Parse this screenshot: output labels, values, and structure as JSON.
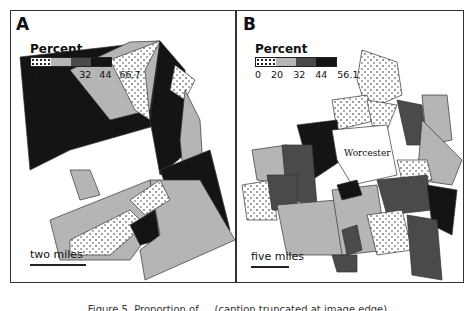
{
  "figure": {
    "panels": [
      {
        "label": "A",
        "legend": {
          "title": "Percent",
          "breaks": [
            "12.3",
            "20",
            "32",
            "44",
            "66.7"
          ],
          "classes": [
            "dotted",
            "light-gray",
            "dark-gray",
            "black"
          ]
        },
        "scale_bar": "two miles"
      },
      {
        "label": "B",
        "legend": {
          "title": "Percent",
          "breaks": [
            "0",
            "20",
            "32",
            "44",
            "56.1"
          ],
          "classes": [
            "dotted",
            "light-gray",
            "dark-gray",
            "black"
          ]
        },
        "scale_bar": "five miles",
        "city_label": "Worcester"
      }
    ],
    "caption": "Figure 5. Proportion of ... (caption truncated at image edge)"
  },
  "colors": {
    "class_1": "#ffffff",
    "class_2": "#b5b5b5",
    "class_3": "#4a4a4a",
    "class_4": "#141414",
    "border": "#333333"
  }
}
